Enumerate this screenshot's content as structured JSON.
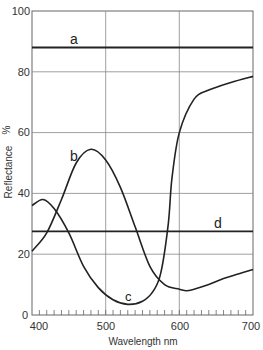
{
  "chart_data": {
    "type": "line",
    "title": "",
    "xlabel": "Wavelength nm",
    "ylabel": "Reflectance %",
    "xlim": [
      400,
      700
    ],
    "ylim": [
      0,
      100
    ],
    "x_ticks": [
      400,
      500,
      600,
      700
    ],
    "y_ticks": [
      0,
      20,
      40,
      60,
      80,
      100
    ],
    "grid": true,
    "legend": "inline labels on curves",
    "series": [
      {
        "name": "a",
        "x": [
          400,
          700
        ],
        "values": [
          88,
          88
        ]
      },
      {
        "name": "b",
        "x": [
          400,
          420,
          440,
          460,
          480,
          500,
          520,
          540,
          560,
          580,
          600,
          610,
          620,
          640,
          660,
          680,
          700
        ],
        "values": [
          21,
          27,
          38,
          50,
          54.5,
          51,
          42,
          29,
          16,
          10,
          8.5,
          8,
          8.5,
          10,
          12,
          13.5,
          15
        ]
      },
      {
        "name": "c",
        "x": [
          400,
          415,
          430,
          450,
          470,
          490,
          510,
          530,
          550,
          565,
          575,
          585,
          590,
          600,
          620,
          640,
          670,
          700
        ],
        "values": [
          36,
          38,
          35,
          27,
          16,
          9,
          5,
          3.5,
          4.5,
          8,
          14,
          30,
          45,
          60,
          71,
          74,
          76.5,
          78.5
        ]
      },
      {
        "name": "d",
        "x": [
          400,
          700
        ],
        "values": [
          27.5,
          27.5
        ]
      }
    ],
    "annotations": [
      "a",
      "b",
      "c",
      "d"
    ]
  },
  "labels": {
    "xlabel": "Wavelength nm",
    "ylabel": "Reflectance",
    "ylabel_unit": "%",
    "x_ticks": [
      "400",
      "500",
      "600",
      "700"
    ],
    "y_ticks": [
      "0",
      "20",
      "40",
      "60",
      "80",
      "100"
    ],
    "curves": {
      "a": "a",
      "b": "b",
      "c": "c",
      "d": "d"
    }
  }
}
